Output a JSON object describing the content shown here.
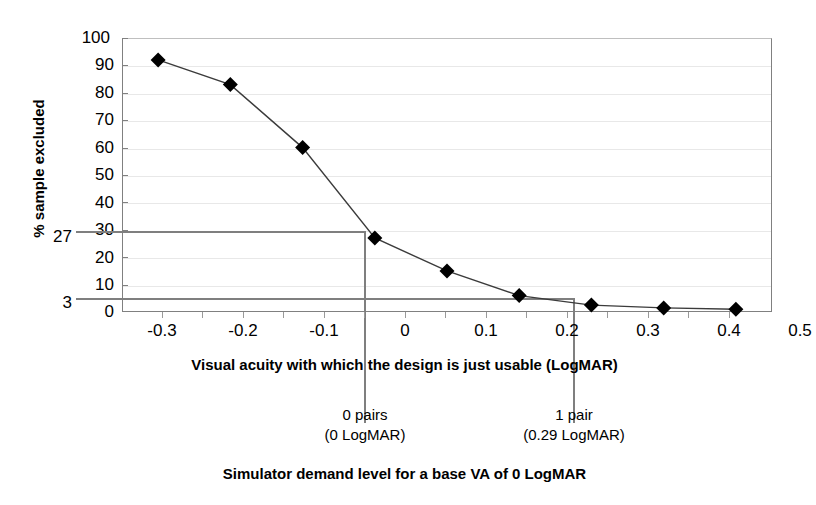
{
  "chart_data": {
    "type": "line",
    "title": "",
    "subtitle": "",
    "xlabel": "Visual acuity with which the design is just usable (LogMAR)",
    "ylabel": "% sample excluded",
    "caption": "Simulator demand level for a base VA of 0 LogMAR",
    "x": [
      -0.3,
      -0.2,
      -0.1,
      0,
      0.1,
      0.2,
      0.3,
      0.4,
      0.5
    ],
    "values": [
      92,
      83,
      60,
      27,
      15,
      6,
      2.5,
      1.5,
      1
    ],
    "series": [
      {
        "name": "% sample excluded",
        "values": [
          92,
          83,
          60,
          27,
          15,
          6,
          2.5,
          1.5,
          1
        ]
      }
    ],
    "xlim": [
      -0.35,
      0.55
    ],
    "ylim": [
      0,
      100
    ],
    "xticks": [
      "-0.3",
      "-0.2",
      "-0.1",
      "0",
      "0.1",
      "0.2",
      "0.3",
      "0.4",
      "0.5"
    ],
    "yticks": [
      "0",
      "10",
      "20",
      "30",
      "40",
      "50",
      "60",
      "70",
      "80",
      "90",
      "100"
    ],
    "grid": true,
    "legend": "none",
    "marker": "diamond",
    "marker_color": "#000000",
    "line_color": "#3b3b3b",
    "gridline_color": "#e8e8e8",
    "axis_color": "#808080",
    "reference_color": "#7f7f7f",
    "highlighted_y_values": [
      "27",
      "3"
    ],
    "reference_lines": [
      {
        "y": 27,
        "x": 0,
        "label": "0 pairs",
        "sublabel": "(0 LogMAR)"
      },
      {
        "y": 3,
        "x": 0.29,
        "label": "1 pair",
        "sublabel": "(0.29 LogMAR)"
      }
    ],
    "annotations": [
      {
        "label": "0 pairs",
        "sublabel": "(0 LogMAR)"
      },
      {
        "label": "1 pair",
        "sublabel": "(0.29 LogMAR)"
      }
    ]
  }
}
